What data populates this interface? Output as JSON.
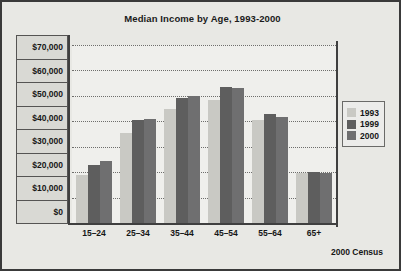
{
  "chart_data": {
    "type": "bar",
    "title": "Median Income by Age, 1993-2000",
    "xlabel": "",
    "ylabel": "",
    "source_note": "2000 Census",
    "categories": [
      "15–24",
      "25–34",
      "35–44",
      "45–54",
      "55–64",
      "65+"
    ],
    "series": [
      {
        "name": "1993",
        "color": "#c9c9c4",
        "values": [
          19000,
          35500,
          45000,
          48500,
          40500,
          19500
        ]
      },
      {
        "name": "1999",
        "color": "#5e5e5e",
        "values": [
          23000,
          40500,
          49000,
          53500,
          43000,
          20000
        ]
      },
      {
        "name": "2000",
        "color": "#6f6f70",
        "values": [
          24500,
          41000,
          50000,
          53000,
          41500,
          19500
        ]
      }
    ],
    "ylim": [
      0,
      70000
    ],
    "ytick_labels": [
      "$70,000",
      "$60,000",
      "$50,000",
      "$40,000",
      "$30,000",
      "$20,000",
      "$10,000",
      "$0"
    ],
    "ytick_values": [
      70000,
      60000,
      50000,
      40000,
      30000,
      20000,
      10000,
      0
    ],
    "grid": true,
    "legend_position": "right"
  },
  "colors": {
    "figure_background": "#e8e8e4",
    "plot_background": "#efefec",
    "frame_border": "#3a3a3a",
    "axis_line": "#3f3f3f",
    "gridline": "#6e6e6c",
    "tick_box_fill": "#d9d9d4",
    "text": "#161616"
  }
}
